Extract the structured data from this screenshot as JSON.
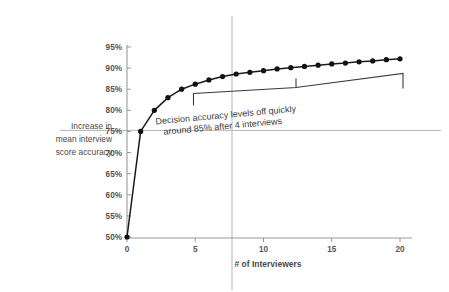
{
  "chart_data": {
    "type": "line",
    "title": "",
    "xlabel": "# of Interviewers",
    "ylabel": "Increase in mean interview score accuracy",
    "xlim": [
      0,
      21
    ],
    "ylim": [
      50,
      95
    ],
    "grid": false,
    "legend": "none",
    "x": [
      0,
      1,
      2,
      3,
      4,
      5,
      6,
      7,
      8,
      9,
      10,
      11,
      12,
      13,
      14,
      15,
      16,
      17,
      18,
      19,
      20
    ],
    "values": [
      50,
      75,
      80,
      83,
      85,
      86.2,
      87.2,
      88,
      88.6,
      89,
      89.4,
      89.8,
      90.1,
      90.4,
      90.7,
      91,
      91.2,
      91.5,
      91.7,
      92,
      92.2
    ],
    "series": [
      {
        "name": "Decision accuracy",
        "values": [
          50,
          75,
          80,
          83,
          85,
          86.2,
          87.2,
          88,
          88.6,
          89,
          89.4,
          89.8,
          90.1,
          90.4,
          90.7,
          91,
          91.2,
          91.5,
          91.7,
          92,
          92.2
        ]
      }
    ],
    "yticks": [
      "50%",
      "55%",
      "60%",
      "65%",
      "70%",
      "75%",
      "80%",
      "85%",
      "90%",
      "95%"
    ],
    "ytick_values": [
      50,
      55,
      60,
      65,
      70,
      75,
      80,
      85,
      90,
      95
    ],
    "xticks": [
      "0",
      "5",
      "10",
      "15",
      "20"
    ],
    "xtick_values": [
      0,
      5,
      10,
      15,
      20
    ],
    "annotations": [
      {
        "name": "plateau-callout",
        "line1": "Decision accuracy levels off quickly",
        "line2": "around 85% after 4 interviews",
        "bracket_from_x": 5,
        "bracket_to_x": 20
      }
    ],
    "reference_lines": [
      {
        "name": "horizontal-75-percent",
        "orientation": "horizontal",
        "value": 75
      },
      {
        "name": "vertical-8-interviewers",
        "orientation": "vertical",
        "value": 8
      }
    ]
  },
  "axis": {
    "y_title_line1": "Increase in",
    "y_title_line2": "mean interview",
    "y_title_line3": "score accuracy",
    "x_title": "# of Interviewers"
  },
  "colors": {
    "series_line": "#1a1a1a",
    "marker": "#111111",
    "axis": "#9a9a9a",
    "reference_line": "#b0b0b0",
    "text": "#4a4a4a",
    "background": "#ffffff"
  }
}
